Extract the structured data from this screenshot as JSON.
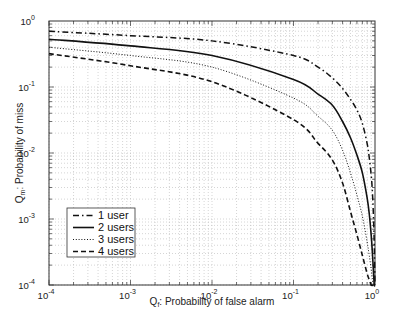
{
  "chart_data": {
    "type": "line",
    "title": "",
    "xlabel": "Q_f: Probability of false alarm",
    "ylabel": "Q_m: Probability of miss",
    "xscale": "log",
    "yscale": "log",
    "xlim": [
      0.0001,
      1
    ],
    "ylim": [
      0.0001,
      1
    ],
    "grid": true,
    "x_ticks": [
      {
        "value": 0.0001,
        "base": "10",
        "exp": "-4"
      },
      {
        "value": 0.001,
        "base": "10",
        "exp": "-3"
      },
      {
        "value": 0.01,
        "base": "10",
        "exp": "-2"
      },
      {
        "value": 0.1,
        "base": "10",
        "exp": "-1"
      },
      {
        "value": 1,
        "base": "10",
        "exp": "0"
      }
    ],
    "y_ticks": [
      {
        "value": 1,
        "base": "10",
        "exp": "0"
      },
      {
        "value": 0.1,
        "base": "10",
        "exp": "-1"
      },
      {
        "value": 0.01,
        "base": "10",
        "exp": "-2"
      },
      {
        "value": 0.001,
        "base": "10",
        "exp": "-3"
      },
      {
        "value": 0.0001,
        "base": "10",
        "exp": "-4"
      }
    ],
    "legend_position": "lower-left",
    "series": [
      {
        "name": "1 user",
        "style": "dash-dot",
        "x": [
          0.0001,
          0.001,
          0.01,
          0.1,
          0.2,
          0.3,
          0.4,
          0.5,
          0.6,
          0.7,
          0.8,
          0.85,
          0.9,
          0.93,
          0.96,
          0.98,
          1.0
        ],
        "y": [
          0.7,
          0.6,
          0.5,
          0.3,
          0.2,
          0.137,
          0.095,
          0.065,
          0.045,
          0.028,
          0.014,
          0.0085,
          0.0045,
          0.0025,
          0.001,
          0.0004,
          0.0001
        ]
      },
      {
        "name": "2 users",
        "style": "solid",
        "x": [
          0.0001,
          0.001,
          0.01,
          0.1,
          0.2,
          0.3,
          0.4,
          0.5,
          0.6,
          0.7,
          0.8,
          0.85,
          0.9,
          0.93,
          0.96,
          0.98,
          1.0
        ],
        "y": [
          0.53,
          0.42,
          0.3,
          0.13,
          0.078,
          0.053,
          0.03,
          0.017,
          0.0093,
          0.005,
          0.0021,
          0.0012,
          0.00055,
          0.0003,
          0.00015,
          0.0001,
          0.0001
        ]
      },
      {
        "name": "3 users",
        "style": "dotted",
        "x": [
          0.0001,
          0.001,
          0.01,
          0.1,
          0.2,
          0.3,
          0.4,
          0.5,
          0.6,
          0.7,
          0.8,
          0.85,
          0.9,
          0.93,
          0.96,
          1.0
        ],
        "y": [
          0.4,
          0.3,
          0.2,
          0.068,
          0.036,
          0.022,
          0.011,
          0.005,
          0.0023,
          0.0011,
          0.00045,
          0.00028,
          0.00017,
          0.00012,
          0.0001,
          0.0001
        ]
      },
      {
        "name": "4 users",
        "style": "dashed",
        "x": [
          0.0001,
          0.001,
          0.01,
          0.1,
          0.2,
          0.3,
          0.4,
          0.5,
          0.6,
          0.7,
          0.8,
          0.85,
          0.9,
          0.95,
          1.0
        ],
        "y": [
          0.32,
          0.21,
          0.12,
          0.032,
          0.014,
          0.0078,
          0.0035,
          0.0013,
          0.00058,
          0.00028,
          0.00015,
          0.00012,
          0.0001,
          0.0001,
          0.0001
        ]
      }
    ]
  },
  "legend": {
    "items": [
      {
        "label": "1 user",
        "style": "dash-dot"
      },
      {
        "label": "2 users",
        "style": "solid"
      },
      {
        "label": "3 users",
        "style": "dotted"
      },
      {
        "label": "4 users",
        "style": "dashed"
      }
    ]
  },
  "axes": {
    "x_label_main": "Q",
    "x_label_sub": "f",
    "x_label_rest": ": Probability of false alarm",
    "y_label_main": "Q",
    "y_label_sub": "m",
    "y_label_rest": ": Probability of miss"
  },
  "colors": {
    "line": "#111111",
    "grid": "#b8b8b8",
    "axis": "#333333",
    "background": "#ffffff"
  }
}
